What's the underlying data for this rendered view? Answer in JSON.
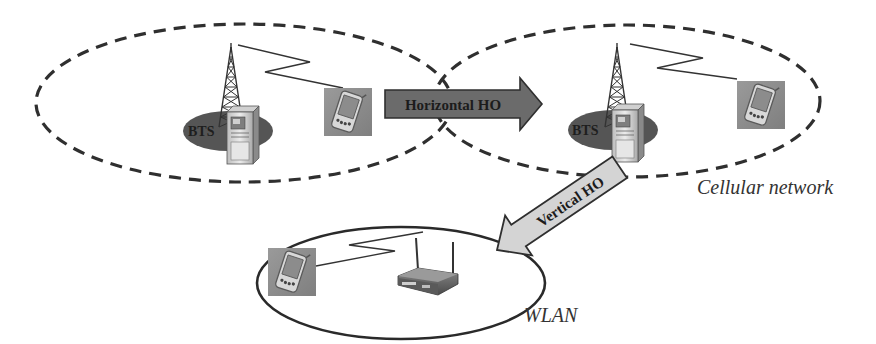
{
  "diagram": {
    "colors": {
      "background": "#ffffff",
      "line": "#2f2f2f",
      "bts_ellipse": "#555555",
      "horizontal_arrow_fill": "#6b6b6b",
      "vertical_arrow_fill": "#d4d4d4",
      "device_bg": "#8f8f8f",
      "label_text": "#333333"
    },
    "cells": [
      {
        "id": "cell-left",
        "style": "dashed",
        "bts_label": "BTS"
      },
      {
        "id": "cell-right",
        "style": "dashed",
        "bts_label": "BTS"
      }
    ],
    "wlan": {
      "style": "solid",
      "label": "WLAN"
    },
    "arrows": {
      "horizontal": {
        "label": "Horizontal HO"
      },
      "vertical": {
        "label": "Vertical HO"
      }
    },
    "labels": {
      "cellular_network": "Cellular network",
      "wlan": "WLAN",
      "bts_left": "BTS",
      "bts_right": "BTS"
    },
    "icons": [
      "cell-tower-icon",
      "base-station-cabinet-icon",
      "pda-mobile-icon",
      "wireless-router-icon",
      "radio-link-zigzag-icon"
    ]
  }
}
